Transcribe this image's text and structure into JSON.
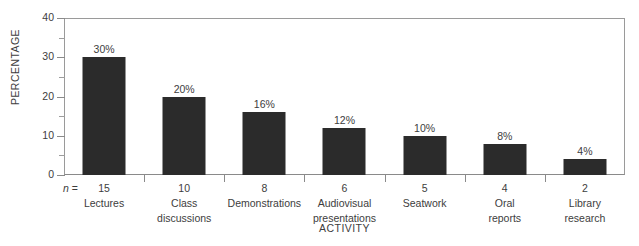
{
  "chart_data": {
    "type": "bar",
    "title": "",
    "xlabel": "ACTIVITY",
    "ylabel": "PERCENTAGE",
    "ylim": [
      0,
      40
    ],
    "grid": false,
    "legend": "none",
    "y_ticks_major": [
      0,
      10,
      20,
      30,
      40
    ],
    "y_ticks_minor": [
      5,
      15,
      25,
      35
    ],
    "y_tick_labels": [
      "0",
      "10",
      "20",
      "30",
      "40"
    ],
    "n_prefix": "n =",
    "categories": [
      "Lectures",
      "Class discussions",
      "Demonstrations",
      "Audiovisual presentations",
      "Seatwork",
      "Oral reports",
      "Library research"
    ],
    "category_lines": [
      [
        "Lectures",
        ""
      ],
      [
        "Class",
        "discussions"
      ],
      [
        "Demonstrations",
        ""
      ],
      [
        "Audiovisual",
        "presentations"
      ],
      [
        "Seatwork",
        ""
      ],
      [
        "Oral",
        "reports"
      ],
      [
        "Library",
        "research"
      ]
    ],
    "values": [
      30,
      20,
      16,
      12,
      10,
      8,
      4
    ],
    "value_labels": [
      "30%",
      "20%",
      "16%",
      "12%",
      "10%",
      "8%",
      "4%"
    ],
    "n_values": [
      15,
      10,
      8,
      6,
      5,
      4,
      2
    ],
    "n_labels": [
      "15",
      "10",
      "8",
      "6",
      "5",
      "4",
      "2"
    ],
    "colors": {
      "bar_fill": "#2b2b2b",
      "axis_line": "#8a8a8a",
      "frame_line": "#9a9a9a",
      "text": "#3d3d3d",
      "background": "#ffffff"
    }
  }
}
